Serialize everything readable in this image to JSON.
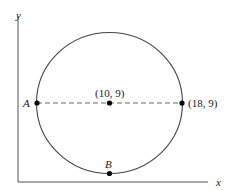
{
  "axes": {
    "x_label": "x",
    "y_label": "y"
  },
  "points": {
    "A": {
      "label": "A"
    },
    "center": {
      "label": "(10, 9)"
    },
    "right": {
      "label": "(18, 9)"
    },
    "B": {
      "label": "B"
    }
  },
  "colors": {
    "stroke": "#333333",
    "background": "#ffffff"
  }
}
